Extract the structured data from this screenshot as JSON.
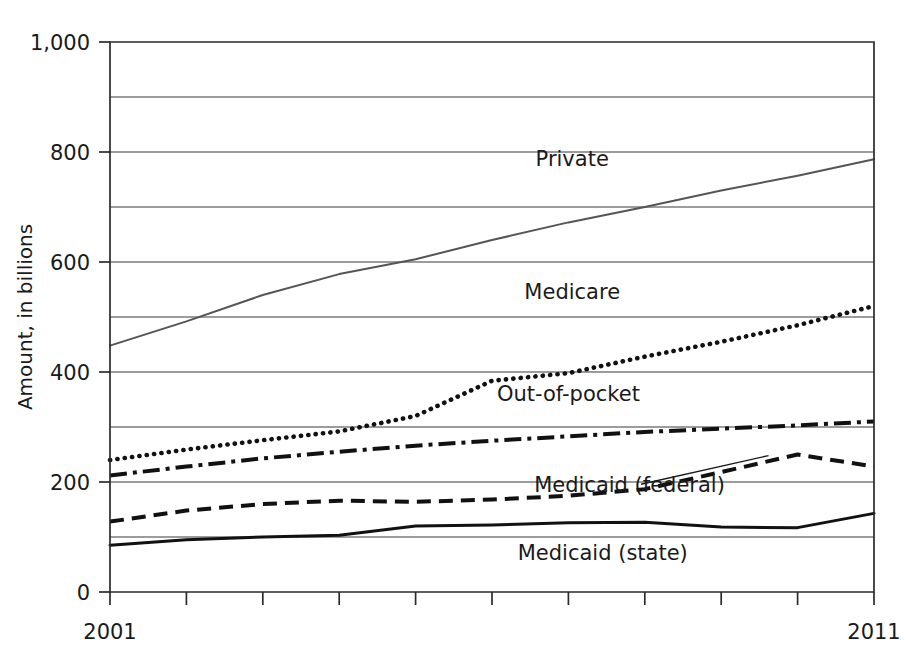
{
  "chart_data": {
    "type": "line",
    "title": "",
    "xlabel": "",
    "ylabel": "Amount, in billions",
    "x": [
      2001,
      2002,
      2003,
      2004,
      2005,
      2006,
      2007,
      2008,
      2009,
      2010,
      2011
    ],
    "xlim": [
      2001,
      2011
    ],
    "ylim": [
      0,
      1000
    ],
    "y_ticks": [
      0,
      200,
      400,
      600,
      800,
      1000
    ],
    "y_tick_labels": [
      "0",
      "200",
      "400",
      "600",
      "800",
      "1,000"
    ],
    "y_gridlines": [
      0,
      100,
      200,
      300,
      400,
      500,
      600,
      700,
      800,
      900,
      1000
    ],
    "x_tick_labels": [
      "2001",
      "",
      "",
      "",
      "",
      "",
      "",
      "",
      "",
      "",
      "2011"
    ],
    "x_axis_labels_shown": [
      "2001",
      "2011"
    ],
    "grid": true,
    "legend": "inline-labels",
    "series": [
      {
        "name": "Private",
        "style": "solid-thin",
        "color": "#555555",
        "values": [
          448,
          492,
          540,
          578,
          605,
          640,
          672,
          700,
          730,
          757,
          787
        ]
      },
      {
        "name": "Medicare",
        "style": "dotted",
        "color": "#111111",
        "values": [
          240,
          259,
          276,
          292,
          320,
          384,
          398,
          428,
          455,
          485,
          520
        ]
      },
      {
        "name": "Out-of-pocket",
        "style": "dash-dot",
        "color": "#111111",
        "values": [
          212,
          228,
          243,
          255,
          266,
          275,
          283,
          291,
          297,
          303,
          310
        ]
      },
      {
        "name": "Medicaid (federal)",
        "style": "dashed",
        "color": "#111111",
        "values": [
          128,
          148,
          160,
          166,
          164,
          168,
          175,
          187,
          218,
          250,
          228
        ]
      },
      {
        "name": "Medicaid (state)",
        "style": "solid-thick",
        "color": "#111111",
        "values": [
          85,
          95,
          100,
          103,
          120,
          122,
          126,
          127,
          118,
          117,
          143
        ]
      }
    ],
    "annotations": [
      {
        "text": "Private",
        "x": 2007.05,
        "y": 775
      },
      {
        "text": "Medicare",
        "x": 2007.05,
        "y": 533
      },
      {
        "text": "Out-of-pocket",
        "x": 2007.0,
        "y": 348
      },
      {
        "text": "Medicaid (federal)",
        "x": 2007.8,
        "y": 182
      },
      {
        "text": "Medicaid (state)",
        "x": 2007.45,
        "y": 58
      }
    ]
  }
}
